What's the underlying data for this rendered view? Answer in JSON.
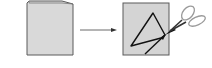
{
  "diagram": {
    "steps": [
      {
        "id": "folded-paper",
        "shape": "folded-rectangle",
        "fill": "#d9d9d9",
        "stroke": "#555555"
      },
      {
        "id": "arrow",
        "shape": "right-arrow",
        "stroke": "#555555"
      },
      {
        "id": "cut-paper",
        "shape": "square-with-triangle",
        "fill": "#d4d4d4",
        "stroke": "#555555"
      },
      {
        "id": "scissors",
        "icon": "scissors-icon",
        "stroke": "#888888"
      }
    ],
    "colors": {
      "paper_fill": "#d9d9d9",
      "paper_stroke": "#5a5a5a",
      "line": "#111111",
      "scissors": "#9a9a9a"
    }
  }
}
